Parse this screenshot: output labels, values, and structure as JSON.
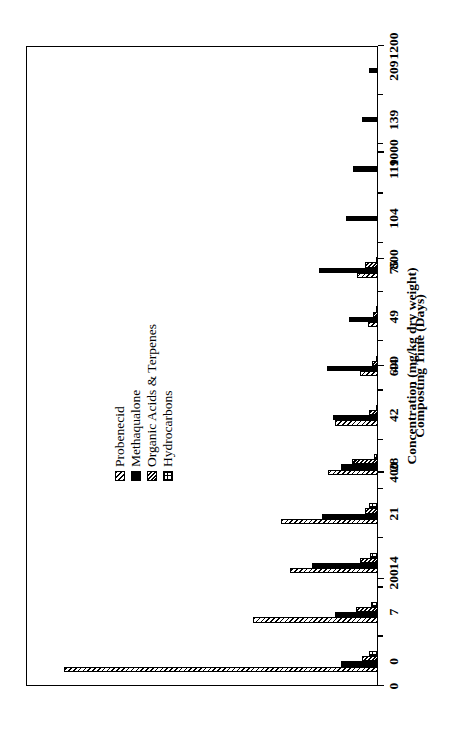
{
  "chart_data": {
    "type": "bar",
    "orientation": "vertical-rotated-90ccw",
    "title": "",
    "xlabel": "Composting Time (Days)",
    "ylabel": "Concentration (mg/kg dry weight)",
    "categories": [
      "0",
      "7",
      "14",
      "21",
      "28",
      "42",
      "44",
      "49",
      "75",
      "104",
      "119",
      "139",
      "209"
    ],
    "ylim": [
      0,
      1200
    ],
    "yticks": [
      0,
      200,
      400,
      600,
      800,
      1000,
      1200
    ],
    "grid": false,
    "legend_position": "upper-left-inside",
    "series": [
      {
        "name": "Probenecid",
        "pattern": "diagonal-hatch",
        "color": "#000000",
        "values": [
          1070,
          425,
          300,
          330,
          170,
          145,
          60,
          35,
          70,
          0,
          0,
          0,
          0
        ]
      },
      {
        "name": "Methaqualone",
        "pattern": "solid-black",
        "color": "#000000",
        "values": [
          125,
          145,
          225,
          190,
          125,
          155,
          175,
          100,
          200,
          110,
          85,
          55,
          30
        ]
      },
      {
        "name": "Organic Acids & Terpenes",
        "pattern": "dense-diagonal-hatch",
        "color": "#000000",
        "values": [
          55,
          75,
          60,
          45,
          90,
          30,
          22,
          18,
          45,
          0,
          0,
          0,
          0
        ]
      },
      {
        "name": "Hydrocarbons",
        "pattern": "cross-hatch-grid",
        "color": "#000000",
        "values": [
          30,
          25,
          28,
          30,
          12,
          8,
          6,
          5,
          8,
          0,
          0,
          0,
          0
        ]
      }
    ]
  },
  "axes": {
    "value_axis_title": "Concentration (mg/kg dry weight)",
    "category_axis_title": "Composting Time (Days)"
  }
}
